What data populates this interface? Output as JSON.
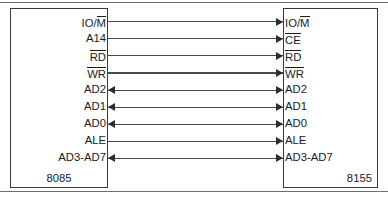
{
  "figure": {
    "left_chip": {
      "name": "8085",
      "pins": [
        {
          "text": "IO/M",
          "overbar_part": "M",
          "prefix": "IO/"
        },
        {
          "text": "A14",
          "overbar_part": "",
          "prefix": "A14"
        },
        {
          "text": "RD",
          "overbar_part": "RD",
          "prefix": ""
        },
        {
          "text": "WR",
          "overbar_part": "WR",
          "prefix": ""
        },
        {
          "text": "AD2",
          "overbar_part": "",
          "prefix": "AD2"
        },
        {
          "text": "AD1",
          "overbar_part": "",
          "prefix": "AD1"
        },
        {
          "text": "AD0",
          "overbar_part": "",
          "prefix": "AD0"
        },
        {
          "text": "ALE",
          "overbar_part": "",
          "prefix": "ALE"
        },
        {
          "text": "AD3-AD7",
          "overbar_part": "",
          "prefix": "AD3-AD7"
        }
      ]
    },
    "right_chip": {
      "name": "8155",
      "pins": [
        {
          "text": "IO/M",
          "overbar_part": "M",
          "prefix": "IO/"
        },
        {
          "text": "CE",
          "overbar_part": "CE",
          "prefix": ""
        },
        {
          "text": "RD",
          "overbar_part": "RD",
          "prefix": ""
        },
        {
          "text": "WR",
          "overbar_part": "WR",
          "prefix": ""
        },
        {
          "text": "AD2",
          "overbar_part": "",
          "prefix": "AD2"
        },
        {
          "text": "AD1",
          "overbar_part": "",
          "prefix": "AD1"
        },
        {
          "text": "AD0",
          "overbar_part": "",
          "prefix": "AD0"
        },
        {
          "text": "ALE",
          "overbar_part": "",
          "prefix": "ALE"
        },
        {
          "text": "AD3-AD7",
          "overbar_part": "",
          "prefix": "AD3-AD7"
        }
      ]
    },
    "connections": [
      {
        "left": "IO/M",
        "right": "IO/M",
        "direction": "right"
      },
      {
        "left": "A14",
        "right": "CE",
        "direction": "right"
      },
      {
        "left": "RD",
        "right": "RD",
        "direction": "right"
      },
      {
        "left": "WR",
        "right": "WR",
        "direction": "right"
      },
      {
        "left": "AD2",
        "right": "AD2",
        "direction": "both"
      },
      {
        "left": "AD1",
        "right": "AD1",
        "direction": "both"
      },
      {
        "left": "AD0",
        "right": "AD0",
        "direction": "both"
      },
      {
        "left": "ALE",
        "right": "ALE",
        "direction": "right"
      },
      {
        "left": "AD3-AD7",
        "right": "AD3-AD7",
        "direction": "both"
      }
    ],
    "colors": {
      "line": "#4a4a4a",
      "box_border": "#3a3a3a",
      "text": "#1b1b1b",
      "rule": "#6f6f6f",
      "background": "#ffffff"
    }
  }
}
